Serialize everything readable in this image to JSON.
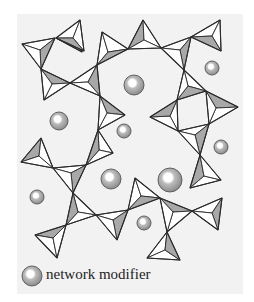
{
  "figure": {
    "background": "#f2f2f2",
    "panel": {
      "x": 17,
      "y": 14,
      "w": 226,
      "h": 280
    },
    "line_color": "#2a2a2a",
    "face_light": "#ffffff",
    "face_shaded": "#a8a8a8",
    "ball_fill": "#9a9a9a",
    "ball_highlight": "#ffffff",
    "tetrahedra": [
      {
        "apex": [
          76,
          40
        ],
        "pts": [
          [
            56,
            38
          ],
          [
            82,
            52
          ],
          [
            74,
            34
          ]
        ]
      },
      {
        "pts": [
          [
            22,
            44
          ],
          [
            55,
            38
          ],
          [
            41,
            69
          ]
        ],
        "center": [
          40,
          50
        ]
      },
      {
        "pts": [
          [
            56,
            38
          ],
          [
            80,
            20
          ],
          [
            84,
            51
          ]
        ],
        "center": [
          73,
          38
        ]
      },
      {
        "pts": [
          [
            41,
            69
          ],
          [
            70,
            83
          ],
          [
            44,
            100
          ]
        ],
        "center": [
          52,
          84
        ]
      },
      {
        "pts": [
          [
            70,
            83
          ],
          [
            97,
            65
          ],
          [
            100,
            96
          ]
        ],
        "center": [
          88,
          82
        ]
      },
      {
        "pts": [
          [
            97,
            65
          ],
          [
            102,
            32
          ],
          [
            128,
            49
          ]
        ],
        "center": [
          108,
          52
        ]
      },
      {
        "pts": [
          [
            128,
            49
          ],
          [
            143,
            20
          ],
          [
            161,
            48
          ]
        ],
        "center": [
          144,
          40
        ]
      },
      {
        "pts": [
          [
            161,
            48
          ],
          [
            191,
            37
          ],
          [
            184,
            70
          ]
        ],
        "center": [
          180,
          50
        ]
      },
      {
        "pts": [
          [
            191,
            37
          ],
          [
            220,
            20
          ],
          [
            221,
            51
          ]
        ],
        "center": [
          212,
          36
        ]
      },
      {
        "pts": [
          [
            100,
            96
          ],
          [
            125,
            115
          ],
          [
            98,
            130
          ]
        ],
        "center": [
          107,
          113
        ]
      },
      {
        "pts": [
          [
            184,
            70
          ],
          [
            206,
            91
          ],
          [
            177,
            100
          ]
        ],
        "center": [
          188,
          86
        ]
      },
      {
        "pts": [
          [
            177,
            100
          ],
          [
            178,
            131
          ],
          [
            150,
            117
          ]
        ],
        "center": [
          170,
          116
        ]
      },
      {
        "pts": [
          [
            206,
            91
          ],
          [
            238,
            107
          ],
          [
            209,
            124
          ]
        ],
        "center": [
          216,
          108
        ]
      },
      {
        "pts": [
          [
            178,
            131
          ],
          [
            209,
            124
          ],
          [
            200,
            155
          ]
        ],
        "center": [
          195,
          135
        ]
      },
      {
        "pts": [
          [
            98,
            130
          ],
          [
            113,
            153
          ],
          [
            86,
            165
          ]
        ],
        "center": [
          99,
          150
        ]
      },
      {
        "pts": [
          [
            41,
            138
          ],
          [
            21,
            162
          ],
          [
            53,
            168
          ]
        ],
        "center": [
          39,
          156
        ]
      },
      {
        "pts": [
          [
            53,
            168
          ],
          [
            86,
            165
          ],
          [
            73,
            193
          ]
        ],
        "center": [
          71,
          173
        ]
      },
      {
        "pts": [
          [
            73,
            193
          ],
          [
            96,
            215
          ],
          [
            66,
            225
          ]
        ],
        "center": [
          78,
          212
        ]
      },
      {
        "pts": [
          [
            66,
            225
          ],
          [
            35,
            235
          ],
          [
            57,
            258
          ]
        ],
        "center": [
          53,
          238
        ]
      },
      {
        "pts": [
          [
            96,
            215
          ],
          [
            128,
            210
          ],
          [
            117,
            240
          ]
        ],
        "center": [
          113,
          220
        ]
      },
      {
        "pts": [
          [
            128,
            210
          ],
          [
            135,
            178
          ],
          [
            160,
            198
          ]
        ],
        "center": [
          141,
          196
        ]
      },
      {
        "pts": [
          [
            160,
            198
          ],
          [
            192,
            211
          ],
          [
            167,
            232
          ]
        ],
        "center": [
          173,
          212
        ]
      },
      {
        "pts": [
          [
            192,
            211
          ],
          [
            222,
            198
          ],
          [
            218,
            230
          ]
        ],
        "center": [
          212,
          213
        ]
      },
      {
        "pts": [
          [
            167,
            232
          ],
          [
            147,
            258
          ],
          [
            180,
            260
          ]
        ],
        "center": [
          165,
          250
        ]
      },
      {
        "pts": [
          [
            200,
            155
          ],
          [
            190,
            188
          ],
          [
            221,
            180
          ]
        ],
        "center": [
          204,
          176
        ]
      }
    ],
    "modifiers": [
      {
        "cx": 134,
        "cy": 85,
        "r": 10
      },
      {
        "cx": 212,
        "cy": 68,
        "r": 7
      },
      {
        "cx": 59,
        "cy": 121,
        "r": 9
      },
      {
        "cx": 124,
        "cy": 131,
        "r": 7
      },
      {
        "cx": 221,
        "cy": 147,
        "r": 7
      },
      {
        "cx": 37,
        "cy": 197,
        "r": 7
      },
      {
        "cx": 111,
        "cy": 179,
        "r": 10
      },
      {
        "cx": 170,
        "cy": 180,
        "r": 12
      },
      {
        "cx": 144,
        "cy": 223,
        "r": 7
      }
    ]
  },
  "legend": {
    "ball": {
      "cx": 32,
      "cy": 276,
      "r": 10
    },
    "label": "network modifier"
  }
}
